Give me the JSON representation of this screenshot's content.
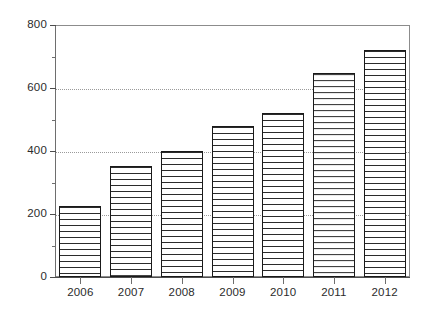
{
  "chart_data": {
    "type": "bar",
    "title": "",
    "subtitle": "",
    "xlabel": "",
    "ylabel": "",
    "categories": [
      "2006",
      "2007",
      "2008",
      "2009",
      "2010",
      "2011",
      "2012"
    ],
    "values": [
      225,
      352,
      400,
      478,
      520,
      648,
      720
    ],
    "series": [
      {
        "name": "",
        "values": [
          225,
          352,
          400,
          478,
          520,
          648,
          720
        ]
      }
    ],
    "ylim": [
      0,
      800
    ],
    "y_major_ticks": [
      0,
      200,
      400,
      600,
      800
    ],
    "y_minor_ticks": [
      100,
      300,
      500,
      700
    ],
    "y_tick_labels": [
      "0",
      "200",
      "400",
      "600",
      "800"
    ],
    "x_tick_labels": [
      "2006",
      "2007",
      "2008",
      "2009",
      "2010",
      "2011",
      "2012"
    ],
    "gridlines": {
      "horizontal": [
        200,
        400,
        600
      ],
      "style": "dotted",
      "color": "#9a9a9a",
      "vertical": []
    },
    "legend": {
      "visible": false,
      "position": "none",
      "entries": []
    },
    "bar_style": {
      "fill": "#ffffff",
      "hatch": "horizontal-lines",
      "hatch_color": "#2b2b2b",
      "edge_color": "#1a1a1a"
    },
    "frame": {
      "visible": true,
      "color": "#8c8c8c"
    },
    "background_color": "#ffffff",
    "axis_color": "#4d4d4d",
    "text_color": "#2b2b2b"
  }
}
